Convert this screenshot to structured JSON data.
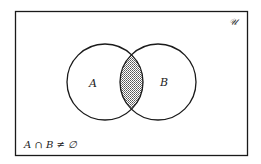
{
  "diagram": {
    "type": "venn",
    "universe_label": "𝒰",
    "sets": [
      {
        "name": "A",
        "label": "A"
      },
      {
        "name": "B",
        "label": "B"
      }
    ],
    "shaded_region": "A ∩ B",
    "caption": "A ∩ B ≠ ∅",
    "colors": {
      "stroke": "#1a1a1a",
      "shading": "#b8b8b8",
      "background": "#ffffff"
    }
  }
}
